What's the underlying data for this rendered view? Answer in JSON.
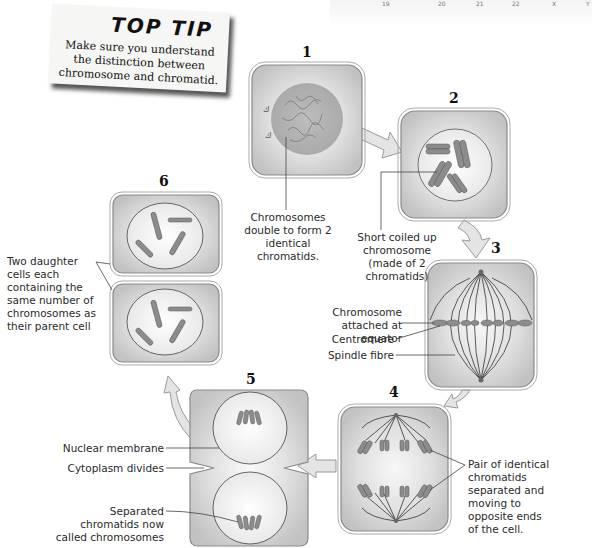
{
  "top_tip": {
    "title": "TOP TIP",
    "body": "Make sure you understand the distinction between chromosome and chromatid."
  },
  "top_strip_labels": [
    "19",
    "20",
    "21",
    "22",
    "X",
    "Y"
  ],
  "stages": [
    {
      "number": "1",
      "label": "Chromosomes double to form 2 identical chromatids."
    },
    {
      "number": "2",
      "label": "Short coiled up chromosome (made of 2 chromatids)"
    },
    {
      "number": "3",
      "labels": [
        "Chromosome attached at equator",
        "Centromere",
        "Spindle fibre"
      ]
    },
    {
      "number": "4",
      "label": "Pair of identical chromatids separated and moving to opposite ends of the cell."
    },
    {
      "number": "5",
      "labels": [
        "Nuclear membrane",
        "Cytoplasm divides",
        "Separated chromatids now called chromosomes"
      ]
    },
    {
      "number": "6",
      "label": "Two daughter cells each containing the same number of chromosomes as their parent cell"
    }
  ],
  "colors": {
    "cell_fill": "#c8c8c8",
    "cell_highlight": "#f4f4f4",
    "outline": "#7a7a7a",
    "arrow_fill": "#e2e2e2",
    "chromosome": "#8c8c8c"
  }
}
